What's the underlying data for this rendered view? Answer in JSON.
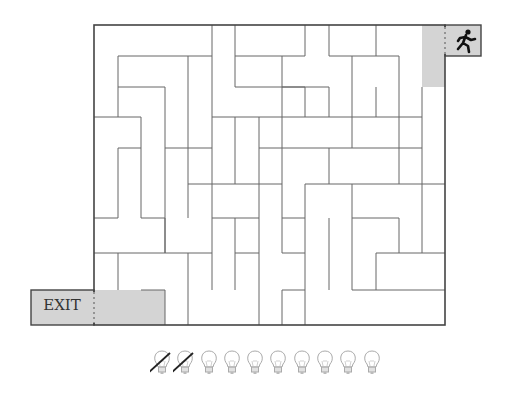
{
  "game": {
    "exit_label": "EXIT",
    "start_icon": "running-man-icon",
    "colors": {
      "wall": "#555555",
      "border": "#444444",
      "shaded_cell": "#d4d4d4",
      "background": "#ffffff"
    }
  },
  "maze": {
    "outer": {
      "x1": 94,
      "y1": 25,
      "x2": 445,
      "y2": 325
    },
    "start_zone": {
      "x": 422,
      "y": 25,
      "w": 23,
      "h": 62
    },
    "start_box": {
      "x": 445,
      "y": 25,
      "w": 36,
      "h": 31
    },
    "exit_zone": {
      "x": 94,
      "y": 290,
      "w": 71,
      "h": 35
    },
    "exit_box": {
      "x": 31,
      "y": 290,
      "w": 63,
      "h": 35
    },
    "walls": [
      [
        118,
        56,
        212,
        56
      ],
      [
        118,
        56,
        118,
        117
      ],
      [
        118,
        87,
        165,
        87
      ],
      [
        165,
        87,
        165,
        148
      ],
      [
        188,
        56,
        188,
        148
      ],
      [
        212,
        25,
        212,
        117
      ],
      [
        235,
        25,
        235,
        87
      ],
      [
        235,
        56,
        305,
        56
      ],
      [
        235,
        87,
        305,
        87
      ],
      [
        212,
        117,
        305,
        117
      ],
      [
        305,
        25,
        305,
        56
      ],
      [
        329,
        25,
        329,
        56
      ],
      [
        376,
        25,
        376,
        56
      ],
      [
        282,
        56,
        282,
        148
      ],
      [
        282,
        87,
        329,
        87
      ],
      [
        329,
        56,
        399,
        56
      ],
      [
        329,
        87,
        329,
        117
      ],
      [
        376,
        87,
        376,
        117
      ],
      [
        399,
        56,
        399,
        117
      ],
      [
        352,
        56,
        352,
        87
      ],
      [
        305,
        87,
        305,
        117
      ],
      [
        305,
        117,
        422,
        117
      ],
      [
        422,
        87,
        422,
        253
      ],
      [
        352,
        87,
        352,
        148
      ],
      [
        94,
        117,
        141,
        117
      ],
      [
        141,
        117,
        141,
        218
      ],
      [
        118,
        148,
        141,
        148
      ],
      [
        118,
        148,
        118,
        218
      ],
      [
        94,
        218,
        118,
        218
      ],
      [
        165,
        148,
        165,
        253
      ],
      [
        188,
        148,
        188,
        218
      ],
      [
        165,
        148,
        212,
        148
      ],
      [
        212,
        117,
        212,
        184
      ],
      [
        235,
        117,
        235,
        184
      ],
      [
        259,
        117,
        259,
        184
      ],
      [
        259,
        148,
        282,
        148
      ],
      [
        282,
        148,
        282,
        218
      ],
      [
        282,
        148,
        422,
        148
      ],
      [
        329,
        148,
        329,
        184
      ],
      [
        399,
        117,
        399,
        184
      ],
      [
        188,
        184,
        282,
        184
      ],
      [
        212,
        184,
        212,
        253
      ],
      [
        259,
        184,
        259,
        253
      ],
      [
        305,
        184,
        305,
        290
      ],
      [
        305,
        184,
        445,
        184
      ],
      [
        352,
        184,
        352,
        218
      ],
      [
        94,
        253,
        165,
        253
      ],
      [
        118,
        253,
        118,
        290
      ],
      [
        141,
        218,
        165,
        218
      ],
      [
        165,
        253,
        212,
        253
      ],
      [
        165,
        290,
        165,
        325
      ],
      [
        188,
        290,
        188,
        325
      ],
      [
        212,
        253,
        212,
        290
      ],
      [
        212,
        218,
        259,
        218
      ],
      [
        235,
        218,
        235,
        290
      ],
      [
        235,
        253,
        259,
        253
      ],
      [
        259,
        253,
        259,
        325
      ],
      [
        282,
        218,
        305,
        218
      ],
      [
        282,
        253,
        305,
        253
      ],
      [
        282,
        218,
        282,
        253
      ],
      [
        282,
        290,
        305,
        290
      ],
      [
        282,
        290,
        282,
        325
      ],
      [
        305,
        290,
        305,
        325
      ],
      [
        352,
        218,
        399,
        218
      ],
      [
        352,
        218,
        352,
        290
      ],
      [
        399,
        218,
        399,
        253
      ],
      [
        376,
        253,
        376,
        290
      ],
      [
        376,
        253,
        445,
        253
      ],
      [
        352,
        290,
        445,
        290
      ],
      [
        141,
        290,
        165,
        290
      ],
      [
        165,
        218,
        165,
        253
      ],
      [
        188,
        253,
        188,
        290
      ],
      [
        329,
        218,
        329,
        290
      ]
    ]
  },
  "lives": {
    "total": 10,
    "used": 2,
    "icon": "lightbulb-icon",
    "used_marker": "strike-icon"
  }
}
